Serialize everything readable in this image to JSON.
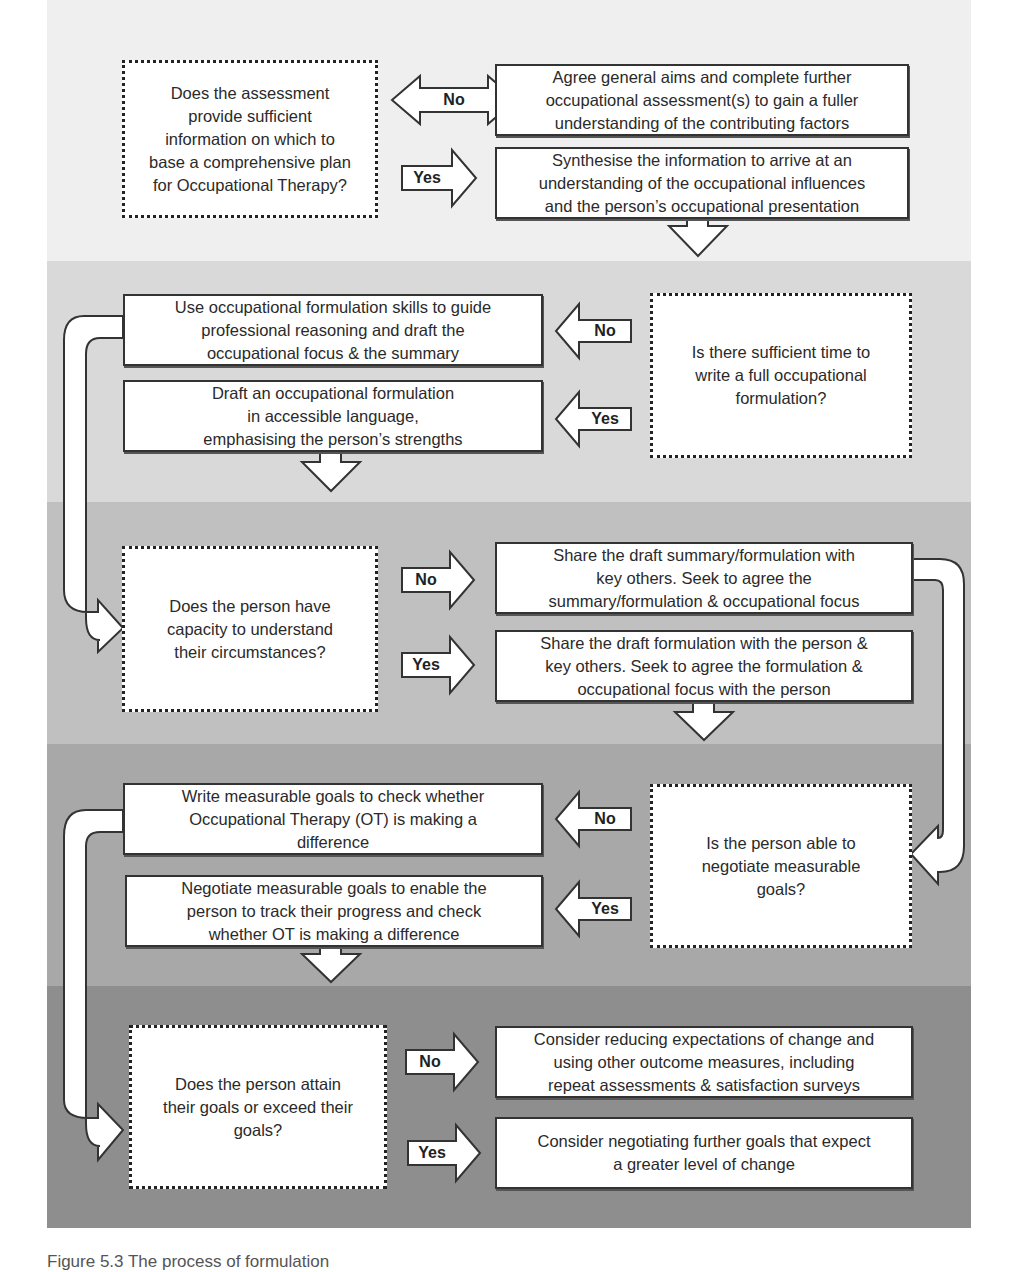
{
  "colors": {
    "band1": "#efefef",
    "band2": "#d9d9d9",
    "band3": "#c0c0c0",
    "band4": "#a8a8a8",
    "band5": "#8e8e8e",
    "box_fill": "#ffffff",
    "stroke": "#333333"
  },
  "stages": [
    {
      "decision": "Does the assessment\nprovide sufficient\ninformation on which to\nbase a comprehensive plan\nfor Occupational Therapy?",
      "no_label": "No",
      "no_action": "Agree general aims and complete further\noccupational assessment(s) to gain a fuller\nunderstanding of the contributing factors",
      "yes_label": "Yes",
      "yes_action": "Synthesise the information to arrive at an\nunderstanding of the occupational influences\nand the person’s occupational presentation"
    },
    {
      "decision": "Is there sufficient time to\nwrite a full occupational\nformulation?",
      "no_label": "No",
      "no_action": "Use occupational formulation skills to guide\nprofessional reasoning and draft the\noccupational focus & the summary",
      "yes_label": "Yes",
      "yes_action": "Draft an occupational formulation\nin accessible language,\nemphasising the person’s strengths"
    },
    {
      "decision": "Does the person have\ncapacity to understand\ntheir circumstances?",
      "no_label": "No",
      "no_action": "Share the draft summary/formulation with\nkey others. Seek to agree the\nsummary/formulation & occupational focus",
      "yes_label": "Yes",
      "yes_action": "Share the draft formulation with the person &\nkey others. Seek to agree the formulation &\noccupational focus with the person"
    },
    {
      "decision": "Is the person able to\nnegotiate measurable\ngoals?",
      "no_label": "No",
      "no_action": "Write measurable goals to check whether\nOccupational Therapy (OT) is making a\ndifference",
      "yes_label": "Yes",
      "yes_action": "Negotiate measurable goals to enable the\nperson to track their progress and check\nwhether OT is making a difference"
    },
    {
      "decision": "Does the person attain\ntheir goals or exceed their\ngoals?",
      "no_label": "No",
      "no_action": "Consider reducing expectations of change and\nusing other outcome measures, including\nrepeat assessments & satisfaction surveys",
      "yes_label": "Yes",
      "yes_action": "Consider negotiating further goals that expect\na greater level of change"
    }
  ],
  "caption": "Figure 5.3 The process of formulation"
}
